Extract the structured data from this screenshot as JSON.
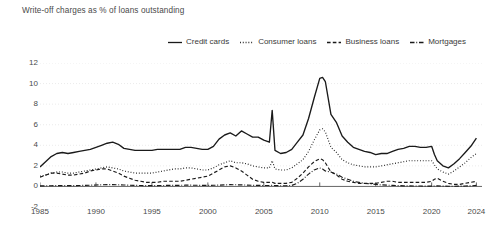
{
  "chart_title": "Write-off charges as % of loans outstanding",
  "legend": {
    "position": "top-center",
    "items": [
      {
        "label": "Credit cards",
        "style": "solid",
        "dash": "none"
      },
      {
        "label": "Consumer loans",
        "style": "dotted",
        "dash": "1,2"
      },
      {
        "label": "Business loans",
        "style": "dashed",
        "dash": "4,2.5"
      },
      {
        "label": "Mortgages",
        "style": "dash-dot",
        "dash": "5,2,1,2"
      }
    ]
  },
  "axes": {
    "y_ticks": [
      "12",
      "10",
      "8",
      "6",
      "4",
      "2",
      "0",
      "-2"
    ],
    "y_values": [
      12,
      10,
      8,
      6,
      4,
      2,
      0,
      -2
    ],
    "x_ticks": [
      "1985",
      "1990",
      "1995",
      "2000",
      "2005",
      "2010",
      "2015",
      "2020",
      "2024"
    ],
    "x_values": [
      1985,
      1990,
      1995,
      2000,
      2005,
      2010,
      2015,
      2020,
      2024
    ]
  },
  "colors": {
    "line": "#1a1a1a",
    "grid": "#e6e6e6",
    "axis": "#555555",
    "text": "#3a3a3a"
  },
  "chart_data": {
    "type": "line",
    "title": "Write-off charges as % of loans outstanding",
    "xlabel": "",
    "ylabel": "",
    "xlim": [
      1985,
      2024.5
    ],
    "ylim": [
      -2,
      12
    ],
    "grid": true,
    "legend_position": "top-center",
    "x": [
      1985,
      1985.5,
      1986,
      1986.5,
      1987,
      1987.5,
      1988,
      1988.5,
      1989,
      1989.5,
      1990,
      1990.5,
      1991,
      1991.5,
      1992,
      1992.5,
      1993,
      1993.5,
      1994,
      1994.5,
      1995,
      1995.5,
      1996,
      1996.5,
      1997,
      1997.5,
      1998,
      1998.5,
      1999,
      1999.5,
      2000,
      2000.5,
      2001,
      2001.5,
      2002,
      2002.5,
      2003,
      2003.5,
      2004,
      2004.5,
      2005,
      2005.5,
      2005.75,
      2006,
      2006.5,
      2007,
      2007.5,
      2008,
      2008.5,
      2009,
      2009.5,
      2010,
      2010.25,
      2010.5,
      2011,
      2011.5,
      2012,
      2012.5,
      2013,
      2013.5,
      2014,
      2014.5,
      2015,
      2015.5,
      2016,
      2016.5,
      2017,
      2017.5,
      2018,
      2018.5,
      2019,
      2019.5,
      2020,
      2020.25,
      2020.5,
      2021,
      2021.5,
      2022,
      2022.5,
      2023,
      2023.5,
      2024
    ],
    "series": [
      {
        "name": "Credit cards",
        "style": "solid",
        "values": [
          1.9,
          2.4,
          2.9,
          3.2,
          3.3,
          3.2,
          3.3,
          3.4,
          3.5,
          3.6,
          3.8,
          4.0,
          4.2,
          4.3,
          4.1,
          3.7,
          3.6,
          3.5,
          3.5,
          3.5,
          3.5,
          3.6,
          3.6,
          3.6,
          3.6,
          3.6,
          3.8,
          3.8,
          3.7,
          3.6,
          3.6,
          3.9,
          4.6,
          5.0,
          5.2,
          4.9,
          5.4,
          5.1,
          4.8,
          4.8,
          4.5,
          4.3,
          7.4,
          3.5,
          3.2,
          3.3,
          3.6,
          4.3,
          5.0,
          6.6,
          8.6,
          10.5,
          10.6,
          10.2,
          7.0,
          6.2,
          4.9,
          4.3,
          3.8,
          3.6,
          3.4,
          3.3,
          3.1,
          3.2,
          3.2,
          3.4,
          3.6,
          3.7,
          3.9,
          3.9,
          3.8,
          3.8,
          3.9,
          3.1,
          2.5,
          2.0,
          1.8,
          2.2,
          2.7,
          3.3,
          3.9,
          4.7
        ]
      },
      {
        "name": "Consumer loans",
        "style": "dotted",
        "values": [
          1.0,
          1.1,
          1.3,
          1.4,
          1.4,
          1.3,
          1.3,
          1.4,
          1.5,
          1.6,
          1.7,
          1.8,
          1.9,
          1.8,
          1.7,
          1.5,
          1.4,
          1.3,
          1.3,
          1.3,
          1.3,
          1.4,
          1.5,
          1.6,
          1.7,
          1.7,
          1.8,
          1.8,
          1.7,
          1.6,
          1.6,
          1.8,
          2.1,
          2.3,
          2.5,
          2.3,
          2.3,
          2.2,
          2.0,
          1.9,
          1.8,
          1.8,
          2.5,
          1.7,
          1.6,
          1.6,
          1.8,
          2.2,
          2.6,
          3.4,
          4.5,
          5.5,
          5.6,
          5.3,
          3.8,
          3.3,
          2.6,
          2.3,
          2.1,
          2.0,
          1.9,
          1.9,
          1.9,
          2.0,
          2.1,
          2.2,
          2.3,
          2.4,
          2.5,
          2.5,
          2.5,
          2.5,
          2.5,
          2.1,
          1.7,
          1.4,
          1.2,
          1.5,
          1.9,
          2.3,
          2.8,
          3.2
        ]
      },
      {
        "name": "Business loans",
        "style": "dashed",
        "values": [
          0.9,
          1.1,
          1.3,
          1.3,
          1.2,
          1.1,
          1.1,
          1.2,
          1.3,
          1.5,
          1.6,
          1.7,
          1.7,
          1.5,
          1.3,
          1.0,
          0.8,
          0.6,
          0.5,
          0.4,
          0.4,
          0.4,
          0.5,
          0.5,
          0.5,
          0.5,
          0.6,
          0.7,
          0.8,
          0.9,
          1.0,
          1.3,
          1.6,
          1.9,
          2.0,
          1.8,
          1.5,
          1.1,
          0.7,
          0.5,
          0.4,
          0.4,
          0.4,
          0.3,
          0.3,
          0.3,
          0.4,
          0.8,
          1.3,
          1.9,
          2.4,
          2.7,
          2.6,
          2.3,
          1.4,
          1.1,
          0.7,
          0.5,
          0.4,
          0.3,
          0.3,
          0.3,
          0.3,
          0.4,
          0.5,
          0.5,
          0.4,
          0.4,
          0.4,
          0.4,
          0.4,
          0.4,
          0.5,
          0.7,
          0.8,
          0.5,
          0.3,
          0.2,
          0.2,
          0.3,
          0.4,
          0.5
        ]
      },
      {
        "name": "Mortgages",
        "style": "dash-dot",
        "values": [
          0.05,
          0.06,
          0.07,
          0.08,
          0.08,
          0.08,
          0.08,
          0.09,
          0.1,
          0.12,
          0.14,
          0.16,
          0.18,
          0.18,
          0.16,
          0.14,
          0.12,
          0.1,
          0.09,
          0.08,
          0.08,
          0.08,
          0.09,
          0.1,
          0.1,
          0.11,
          0.12,
          0.12,
          0.11,
          0.1,
          0.1,
          0.11,
          0.13,
          0.15,
          0.17,
          0.16,
          0.15,
          0.13,
          0.11,
          0.1,
          0.09,
          0.09,
          0.1,
          0.08,
          0.07,
          0.07,
          0.1,
          0.3,
          0.7,
          1.2,
          1.6,
          1.8,
          1.7,
          1.5,
          1.4,
          1.2,
          0.9,
          0.7,
          0.5,
          0.4,
          0.3,
          0.25,
          0.2,
          0.15,
          0.12,
          0.1,
          0.08,
          0.06,
          0.05,
          0.04,
          0.04,
          0.03,
          0.03,
          0.04,
          0.05,
          0.03,
          0.02,
          0.02,
          0.03,
          0.04,
          0.06,
          0.1
        ]
      }
    ]
  }
}
